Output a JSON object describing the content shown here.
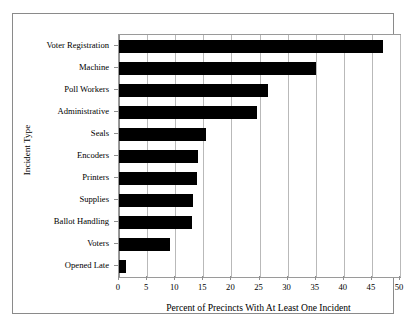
{
  "chart_data": {
    "type": "bar",
    "orientation": "horizontal",
    "title": "",
    "xlabel": "Percent of Precincts With At Least One Incident",
    "ylabel": "Incident Type",
    "xlim": [
      0,
      50
    ],
    "xticks": [
      0,
      5,
      10,
      15,
      20,
      25,
      30,
      35,
      40,
      45,
      50
    ],
    "xtick_labels": [
      "0",
      "5",
      "10",
      "15",
      "20",
      "25",
      "30",
      "35",
      "40",
      "45",
      "50"
    ],
    "grid": "vertical",
    "legend": "none",
    "bar_color": "#000000",
    "categories": [
      "Voter Registration",
      "Machine",
      "Poll Workers",
      "Administrative",
      "Seals",
      "Encoders",
      "Printers",
      "Supplies",
      "Ballot Handling",
      "Voters",
      "Opened Late"
    ],
    "values": [
      47,
      35,
      26.5,
      24.5,
      15.5,
      14,
      13.8,
      13.2,
      13,
      9,
      1.3
    ]
  }
}
